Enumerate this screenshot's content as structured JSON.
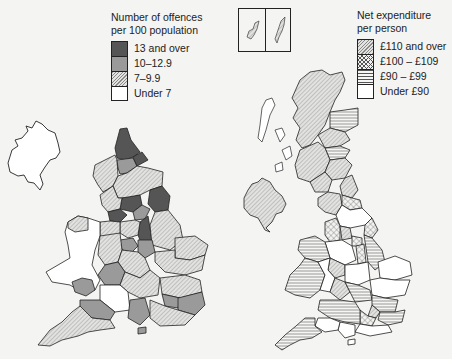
{
  "left_map": {
    "legend": {
      "title_line1": "Number of offences",
      "title_line2": "per 100 population",
      "items": [
        {
          "label": "13 and over",
          "fill": "dark-grey",
          "color": "#555555"
        },
        {
          "label": "10–12.9",
          "fill": "mid-grey",
          "color": "#9a9a9a"
        },
        {
          "label": "7–9.9",
          "fill": "diagonal-hatch",
          "color": "#d8d8d8"
        },
        {
          "label": "Under 7",
          "fill": "white",
          "color": "#ffffff"
        }
      ]
    },
    "region": "England and Wales (with Northern Ireland outline)"
  },
  "right_map": {
    "legend": {
      "title_line1": "Net expenditure",
      "title_line2": "per person",
      "items": [
        {
          "label": "£110 and over",
          "fill": "diagonal-hatch"
        },
        {
          "label": "£100 – £109",
          "fill": "cross-hatch"
        },
        {
          "label": "£90 – £99",
          "fill": "horizontal-lines"
        },
        {
          "label": "Under £90",
          "fill": "white"
        }
      ]
    },
    "region": "United Kingdom",
    "inset": "Orkney and Shetland"
  }
}
